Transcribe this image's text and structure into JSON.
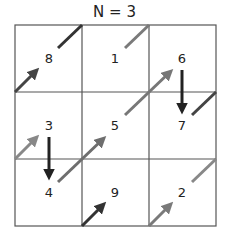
{
  "title": "N = 3",
  "grid": {
    "size": 3,
    "cells": [
      [
        8,
        1,
        6
      ],
      [
        3,
        5,
        7
      ],
      [
        4,
        9,
        2
      ]
    ]
  },
  "numbers": [
    {
      "label": "8",
      "x": 49,
      "y": 63
    },
    {
      "label": "1",
      "x": 115,
      "y": 63
    },
    {
      "label": "6",
      "x": 182,
      "y": 63
    },
    {
      "label": "3",
      "x": 49,
      "y": 130
    },
    {
      "label": "5",
      "x": 115,
      "y": 130
    },
    {
      "label": "7",
      "x": 182,
      "y": 130
    },
    {
      "label": "4",
      "x": 49,
      "y": 197
    },
    {
      "label": "9",
      "x": 115,
      "y": 197
    },
    {
      "label": "2",
      "x": 182,
      "y": 197
    }
  ],
  "moves": [
    {
      "from": "1",
      "to": "2",
      "color": "#7a7a7a"
    },
    {
      "from": "2",
      "to": "3",
      "color": "#888888"
    },
    {
      "from": "3",
      "to": "4",
      "color": "#222222"
    },
    {
      "from": "4",
      "to": "5",
      "color": "#6e6e6e"
    },
    {
      "from": "5",
      "to": "6",
      "color": "#777777"
    },
    {
      "from": "6",
      "to": "7",
      "color": "#222222"
    },
    {
      "from": "7",
      "to": "8",
      "color": "#444444"
    },
    {
      "from": "8",
      "to": "9",
      "color": "#333333"
    }
  ]
}
